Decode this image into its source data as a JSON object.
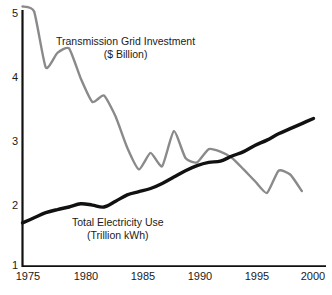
{
  "chart_data": {
    "type": "line",
    "title": "",
    "xlabel": "",
    "ylabel": "",
    "xlim": [
      1974.3,
      2000.8
    ],
    "ylim": [
      1,
      5.15
    ],
    "grid": false,
    "legend_position": "inline-annotation",
    "x_ticks": [
      "1975",
      "1980",
      "1985",
      "1990",
      "1995",
      "2000"
    ],
    "x_tick_values": [
      1975,
      1980,
      1985,
      1990,
      1995,
      2000
    ],
    "y_ticks": [
      "1",
      "2",
      "3",
      "4",
      "5"
    ],
    "y_tick_values": [
      1,
      2,
      3,
      4,
      5
    ],
    "series": [
      {
        "name": "Transmission Grid Investment",
        "unit": "($ Billion)",
        "color": "#8a8a8a",
        "annotation_line1": "Transmission Grid Investment",
        "annotation_line2": "($ Billion)",
        "x": [
          1975,
          1976,
          1977,
          1978,
          1979,
          1980,
          1981,
          1982,
          1983,
          1984,
          1985,
          1986,
          1987,
          1988,
          1989,
          1990,
          1991,
          1992,
          1993,
          1994,
          1995,
          1996,
          1997,
          1998,
          1999
        ],
        "values": [
          5.08,
          5.0,
          4.12,
          4.35,
          4.42,
          3.95,
          3.58,
          3.68,
          3.35,
          2.86,
          2.52,
          2.78,
          2.57,
          3.12,
          2.7,
          2.63,
          2.84,
          2.8,
          2.7,
          2.52,
          2.33,
          2.15,
          2.5,
          2.44,
          2.18
        ]
      },
      {
        "name": "Total Electricity Use",
        "unit": "(Trillion kWh)",
        "color": "#111111",
        "annotation_line1": "Total Electricity Use",
        "annotation_line2": "(Trillion kWh)",
        "x": [
          1975,
          1976,
          1977,
          1978,
          1979,
          1980,
          1981,
          1982,
          1983,
          1984,
          1985,
          1986,
          1987,
          1988,
          1989,
          1990,
          1991,
          1992,
          1993,
          1994,
          1995,
          1996,
          1997,
          1998,
          1999,
          2000
        ],
        "values": [
          1.68,
          1.76,
          1.84,
          1.89,
          1.93,
          1.98,
          1.96,
          1.93,
          2.02,
          2.12,
          2.17,
          2.22,
          2.3,
          2.4,
          2.5,
          2.58,
          2.63,
          2.65,
          2.73,
          2.8,
          2.9,
          2.98,
          3.08,
          3.16,
          3.24,
          3.32
        ]
      }
    ]
  },
  "axis": {
    "axis_color": "#111111"
  }
}
